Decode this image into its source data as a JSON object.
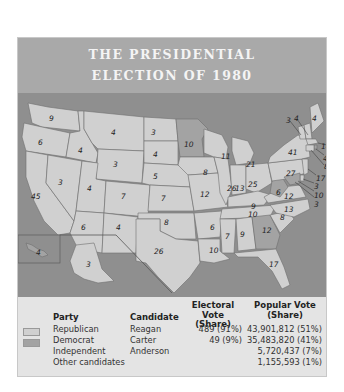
{
  "title": {
    "line1": "THE PRESIDENTIAL",
    "line2": "ELECTION OF 1980"
  },
  "colors": {
    "header_bg": "#a9a9a9",
    "ocean": "#8f8f8f",
    "republican": "#d0d0d0",
    "democrat": "#a3a3a3",
    "table_bg": "#e4e4e4"
  },
  "map": {
    "states": [
      {
        "name": "Washington",
        "ev": "9",
        "party": "Republican"
      },
      {
        "name": "Oregon",
        "ev": "6",
        "party": "Republican"
      },
      {
        "name": "California",
        "ev": "45",
        "party": "Republican"
      },
      {
        "name": "Idaho",
        "ev": "4",
        "party": "Republican"
      },
      {
        "name": "Nevada",
        "ev": "3",
        "party": "Republican"
      },
      {
        "name": "Montana",
        "ev": "4",
        "party": "Republican"
      },
      {
        "name": "Wyoming",
        "ev": "3",
        "party": "Republican"
      },
      {
        "name": "Utah",
        "ev": "4",
        "party": "Republican"
      },
      {
        "name": "Colorado",
        "ev": "7",
        "party": "Republican"
      },
      {
        "name": "Arizona",
        "ev": "6",
        "party": "Republican"
      },
      {
        "name": "New Mexico",
        "ev": "4",
        "party": "Republican"
      },
      {
        "name": "North Dakota",
        "ev": "3",
        "party": "Republican"
      },
      {
        "name": "South Dakota",
        "ev": "4",
        "party": "Republican"
      },
      {
        "name": "Nebraska",
        "ev": "5",
        "party": "Republican"
      },
      {
        "name": "Kansas",
        "ev": "7",
        "party": "Republican"
      },
      {
        "name": "Oklahoma",
        "ev": "8",
        "party": "Republican"
      },
      {
        "name": "Texas",
        "ev": "26",
        "party": "Republican"
      },
      {
        "name": "Minnesota",
        "ev": "10",
        "party": "Democrat"
      },
      {
        "name": "Iowa",
        "ev": "8",
        "party": "Republican"
      },
      {
        "name": "Missouri",
        "ev": "12",
        "party": "Republican"
      },
      {
        "name": "Arkansas",
        "ev": "6",
        "party": "Republican"
      },
      {
        "name": "Louisiana",
        "ev": "10",
        "party": "Republican"
      },
      {
        "name": "Wisconsin",
        "ev": "11",
        "party": "Republican"
      },
      {
        "name": "Illinois",
        "ev": "26",
        "party": "Republican"
      },
      {
        "name": "Michigan",
        "ev": "21",
        "party": "Republican"
      },
      {
        "name": "Indiana",
        "ev": "13",
        "party": "Republican"
      },
      {
        "name": "Ohio",
        "ev": "25",
        "party": "Republican"
      },
      {
        "name": "Kentucky",
        "ev": "9",
        "party": "Republican"
      },
      {
        "name": "Tennessee",
        "ev": "10",
        "party": "Republican"
      },
      {
        "name": "Mississippi",
        "ev": "7",
        "party": "Republican"
      },
      {
        "name": "Alabama",
        "ev": "9",
        "party": "Republican"
      },
      {
        "name": "Georgia",
        "ev": "12",
        "party": "Democrat"
      },
      {
        "name": "Florida",
        "ev": "17",
        "party": "Republican"
      },
      {
        "name": "South Carolina",
        "ev": "8",
        "party": "Republican"
      },
      {
        "name": "North Carolina",
        "ev": "13",
        "party": "Republican"
      },
      {
        "name": "Virginia",
        "ev": "12",
        "party": "Republican"
      },
      {
        "name": "West Virginia",
        "ev": "6",
        "party": "Democrat"
      },
      {
        "name": "Pennsylvania",
        "ev": "27",
        "party": "Republican"
      },
      {
        "name": "New York",
        "ev": "41",
        "party": "Republican"
      },
      {
        "name": "Vermont",
        "ev": "3",
        "party": "Republican"
      },
      {
        "name": "New Hampshire",
        "ev": "4",
        "party": "Republican"
      },
      {
        "name": "Maine",
        "ev": "4",
        "party": "Republican"
      },
      {
        "name": "Massachusetts",
        "ev": "14",
        "party": "Republican"
      },
      {
        "name": "Rhode Island",
        "ev": "4",
        "party": "Democrat"
      },
      {
        "name": "Connecticut",
        "ev": "8",
        "party": "Republican"
      },
      {
        "name": "New Jersey",
        "ev": "17",
        "party": "Republican"
      },
      {
        "name": "Delaware",
        "ev": "3",
        "party": "Republican"
      },
      {
        "name": "Maryland",
        "ev": "10",
        "party": "Democrat"
      },
      {
        "name": "District of Columbia",
        "ev": "3",
        "party": "Democrat"
      },
      {
        "name": "Alaska",
        "ev": "3",
        "party": "Republican"
      },
      {
        "name": "Hawaii",
        "ev": "4",
        "party": "Democrat"
      }
    ]
  },
  "table": {
    "headers": {
      "party": "Party",
      "candidate": "Candidate",
      "electoral_line1": "Electoral Vote",
      "electoral_line2": "(Share)",
      "popular_line1": "Popular Vote",
      "popular_line2": "(Share)"
    },
    "rows": [
      {
        "party": "Republican",
        "candidate": "Reagan",
        "electoral": "489 (91%)",
        "popular": "43,901,812 (51%)"
      },
      {
        "party": "Democrat",
        "candidate": "Carter",
        "electoral": "49 (9%)",
        "popular": "35,483,820 (41%)"
      },
      {
        "party": "Independent",
        "candidate": "Anderson",
        "electoral": "",
        "popular": "5,720,437 (7%)"
      },
      {
        "party": "Other candidates",
        "candidate": "",
        "electoral": "",
        "popular": "1,155,593 (1%)"
      }
    ]
  }
}
